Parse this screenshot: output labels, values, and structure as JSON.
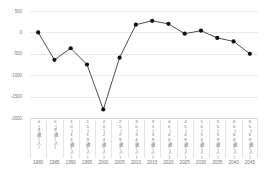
{
  "chart_data": {
    "type": "line",
    "title": "",
    "subtitle": "",
    "xlabel": "",
    "ylabel": "",
    "ylim": [
      -2000,
      500
    ],
    "ytick_labels": [
      "500",
      "0",
      "-500",
      "-1000",
      "-1500",
      "-2000"
    ],
    "ytick_values": [
      500,
      0,
      -500,
      -1000,
      -1500,
      -2000
    ],
    "grid": true,
    "legend": "none",
    "marker": "filled-circle",
    "line_color": "#3a3a3a",
    "marker_color": "#111111",
    "grid_color": "#e9e9e9",
    "x": [
      1980,
      1985,
      1990,
      1995,
      2000,
      2005,
      2010,
      2015,
      2020,
      2025,
      2030,
      2035,
      2040,
      2045
    ],
    "categories": [
      "0〜4歳(人)",
      "5〜9歳(人)",
      "10〜14歳(人)",
      "15〜19歳(人)",
      "20〜24歳(人)",
      "25〜29歳(人)",
      "30〜34歳(人)",
      "35〜39歳(人)",
      "40〜44歳(人)",
      "45〜49歳(人)",
      "50〜54歳(人)",
      "55〜59歳(人)",
      "60〜64歳(人)",
      "65〜69歳(人)"
    ],
    "xtick_labels": [
      "1980",
      "1985",
      "1990",
      "1995",
      "2000",
      "2005",
      "2010",
      "2015",
      "2020",
      "2025",
      "2030",
      "2035",
      "2040",
      "2045"
    ],
    "values": [
      0,
      -640,
      -370,
      -750,
      -1800,
      -590,
      180,
      270,
      200,
      -30,
      40,
      -130,
      -210,
      -500
    ],
    "series": [
      {
        "name": "増減数",
        "values": [
          0,
          -640,
          -370,
          -750,
          -1800,
          -590,
          180,
          270,
          200,
          -30,
          40,
          -130,
          -210,
          -500
        ]
      }
    ]
  }
}
